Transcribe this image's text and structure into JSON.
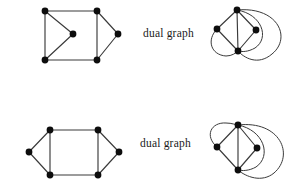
{
  "figure": {
    "title": "",
    "background_color": "#ffffff",
    "ink_color": "#2f2f2f",
    "vertex_color": "#0d0d0d",
    "label_top": "dual graph",
    "label_bottom": "dual graph"
  },
  "rows": [
    {
      "id": "row-top",
      "label": "dual graph",
      "primal": {
        "name": "primal-graph-top",
        "description": "square with an interior vertex joined to the two left corners and an exterior right vertex joined to the two right corners",
        "vertex_count": 6,
        "edge_count": 8,
        "vertices": [
          {
            "id": "v1",
            "label": "top-left",
            "x": 45,
            "y": 11
          },
          {
            "id": "v2",
            "label": "top-right",
            "x": 97,
            "y": 11
          },
          {
            "id": "v3",
            "label": "bottom-right",
            "x": 97,
            "y": 60
          },
          {
            "id": "v4",
            "label": "bottom-left",
            "x": 45,
            "y": 60
          },
          {
            "id": "v5",
            "label": "interior",
            "x": 73,
            "y": 34
          },
          {
            "id": "v6",
            "label": "right-apex",
            "x": 118,
            "y": 34
          }
        ],
        "edges": [
          {
            "from": "v1",
            "to": "v2"
          },
          {
            "from": "v2",
            "to": "v3"
          },
          {
            "from": "v3",
            "to": "v4"
          },
          {
            "from": "v4",
            "to": "v1"
          },
          {
            "from": "v1",
            "to": "v5"
          },
          {
            "from": "v4",
            "to": "v5"
          },
          {
            "from": "v2",
            "to": "v6"
          },
          {
            "from": "v3",
            "to": "v6"
          }
        ]
      },
      "dual": {
        "name": "dual-graph-top",
        "description": "four vertices in a diamond with straight chords plus three large enclosing arcs",
        "vertex_count": 4,
        "edge_count": 8,
        "vertices": [
          {
            "id": "d1",
            "label": "top",
            "x": 237,
            "y": 10
          },
          {
            "id": "d2",
            "label": "left",
            "x": 217,
            "y": 29
          },
          {
            "id": "d3",
            "label": "right",
            "x": 256,
            "y": 30
          },
          {
            "id": "d4",
            "label": "bottom",
            "x": 238,
            "y": 51
          }
        ],
        "straight_edges": [
          {
            "from": "d1",
            "to": "d2"
          },
          {
            "from": "d1",
            "to": "d3"
          },
          {
            "from": "d1",
            "to": "d4"
          },
          {
            "from": "d2",
            "to": "d4"
          },
          {
            "from": "d3",
            "to": "d4"
          }
        ],
        "curved_edges": [
          {
            "from": "d1",
            "to": "d4",
            "bulge": "right-inner"
          },
          {
            "from": "d2",
            "to": "d4",
            "bulge": "left-outer"
          },
          {
            "from": "d1",
            "to": "d4",
            "bulge": "right-outer-large"
          }
        ]
      }
    },
    {
      "id": "row-bottom",
      "label": "dual graph",
      "primal": {
        "name": "primal-graph-bottom",
        "description": "hexagon: central square with one vertex to the left and one vertex to the right",
        "vertex_count": 6,
        "edge_count": 8,
        "vertices": [
          {
            "id": "w1",
            "label": "top-left",
            "x": 50,
            "y": 130
          },
          {
            "id": "w2",
            "label": "top-right",
            "x": 98,
            "y": 130
          },
          {
            "id": "w3",
            "label": "bottom-right",
            "x": 98,
            "y": 175
          },
          {
            "id": "w4",
            "label": "bottom-left",
            "x": 50,
            "y": 175
          },
          {
            "id": "w5",
            "label": "left-apex",
            "x": 29,
            "y": 152
          },
          {
            "id": "w6",
            "label": "right-apex",
            "x": 119,
            "y": 152
          }
        ],
        "edges": [
          {
            "from": "w1",
            "to": "w2"
          },
          {
            "from": "w2",
            "to": "w3"
          },
          {
            "from": "w3",
            "to": "w4"
          },
          {
            "from": "w4",
            "to": "w1"
          },
          {
            "from": "w1",
            "to": "w5"
          },
          {
            "from": "w4",
            "to": "w5"
          },
          {
            "from": "w2",
            "to": "w6"
          },
          {
            "from": "w3",
            "to": "w6"
          }
        ]
      },
      "dual": {
        "name": "dual-graph-bottom",
        "description": "four vertices in a diamond with straight chords plus three large enclosing arcs",
        "vertex_count": 4,
        "edge_count": 8,
        "vertices": [
          {
            "id": "e1",
            "label": "top",
            "x": 238,
            "y": 125
          },
          {
            "id": "e2",
            "label": "left",
            "x": 217,
            "y": 147
          },
          {
            "id": "e3",
            "label": "right",
            "x": 257,
            "y": 148
          },
          {
            "id": "e4",
            "label": "bottom",
            "x": 238,
            "y": 170
          }
        ],
        "straight_edges": [
          {
            "from": "e1",
            "to": "e2"
          },
          {
            "from": "e1",
            "to": "e3"
          },
          {
            "from": "e1",
            "to": "e4"
          },
          {
            "from": "e2",
            "to": "e4"
          },
          {
            "from": "e3",
            "to": "e4"
          }
        ],
        "curved_edges": [
          {
            "from": "e1",
            "to": "e4",
            "bulge": "right-inner"
          },
          {
            "from": "e2",
            "to": "e4",
            "bulge": "left-outer"
          },
          {
            "from": "e1",
            "to": "e4",
            "bulge": "right-outer-large"
          }
        ]
      }
    }
  ]
}
